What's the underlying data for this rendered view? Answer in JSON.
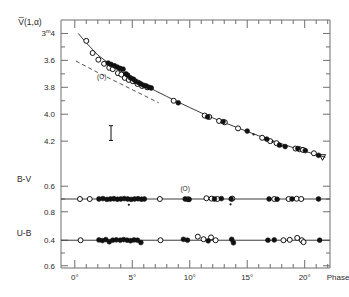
{
  "figure": {
    "background": "#ffffff",
    "frame_color": "#6e6e6e",
    "data_color": "#111111",
    "curve_color": "#3a3a3a"
  },
  "axes": {
    "x": {
      "label": "Phase",
      "unit": "degrees",
      "min": -1.2,
      "max": 22.2,
      "tick_labels": [
        "0°",
        "5°",
        "10°",
        "15°",
        "20°"
      ],
      "tick_values": [
        0,
        5,
        10,
        15,
        20
      ],
      "minor_step": 1
    },
    "panel_v": {
      "label": "V̅(1,α)",
      "tick_labels": [
        "3ᵐ4",
        "3.6",
        "3.8",
        "4.0",
        "4.2"
      ],
      "tick_values": [
        3.4,
        3.6,
        3.8,
        4.0,
        4.2
      ],
      "first_tick_sup": "m",
      "ymin": 3.3,
      "ymax": 4.34,
      "inverted": true
    },
    "panel_bv": {
      "label": "B-V",
      "tick_labels": [
        "0.6",
        "0.8"
      ],
      "tick_values": [
        0.6,
        0.8
      ],
      "ymin": 0.52,
      "ymax": 0.88,
      "inverted": true,
      "fit_line_value": 0.7
    },
    "panel_ub": {
      "label": "U-B",
      "tick_labels": [
        "0.4",
        "0.6"
      ],
      "tick_values": [
        0.4,
        0.6
      ],
      "ymin": 0.32,
      "ymax": 0.68,
      "inverted": true,
      "fit_line_value": 0.4
    }
  },
  "annotations": [
    {
      "name": "opposition-label-v",
      "text": "(O)",
      "x": 2.35,
      "panel": "v",
      "y": 3.74
    },
    {
      "name": "opposition-label-bv",
      "text": "(O)",
      "x": 9.6,
      "panel": "bv",
      "y": 0.635
    }
  ],
  "error_bar": {
    "name": "error-bar-v",
    "x": 3.15,
    "y_center": 4.14,
    "half_height": 0.055
  },
  "chart_data": {
    "type": "scatter",
    "title": "",
    "xlabel": "Phase",
    "ylabel": "V̅(1,α)",
    "xlim": [
      -1.2,
      22.2
    ],
    "grid": false,
    "legend": "none",
    "panels": [
      {
        "name": "V(1,alpha)",
        "ylabel": "V̅(1,α)",
        "ylim": [
          3.3,
          4.34
        ],
        "y_inverted": true,
        "series": [
          {
            "name": "open-circles",
            "marker": "open-circle",
            "x": [
              1.0,
              1.55,
              2.05,
              2.55,
              3.0,
              3.3,
              3.75,
              4.05,
              4.35,
              4.7,
              5.05,
              5.45,
              5.85,
              6.3,
              8.6,
              11.3,
              11.7,
              12.55,
              13.05,
              14.2,
              16.3,
              17.0,
              17.55,
              19.2,
              19.55,
              19.85,
              20.8
            ],
            "y": [
              3.455,
              3.545,
              3.595,
              3.625,
              3.655,
              3.665,
              3.695,
              3.705,
              3.73,
              3.745,
              3.755,
              3.775,
              3.79,
              3.8,
              3.9,
              4.01,
              4.02,
              4.05,
              4.06,
              4.105,
              4.175,
              4.2,
              4.215,
              4.255,
              4.26,
              4.265,
              4.29
            ]
          },
          {
            "name": "filled-circles",
            "marker": "filled-circle",
            "x": [
              2.9,
              3.15,
              3.45,
              3.7,
              3.95,
              4.2,
              4.45,
              4.6,
              4.85,
              5.1,
              5.3,
              5.55,
              5.75,
              6.0,
              6.2,
              6.45,
              6.65,
              9.0,
              11.55,
              12.9,
              15.0,
              16.7,
              17.8,
              18.3,
              19.4,
              20.05,
              21.2
            ],
            "y": [
              3.62,
              3.63,
              3.64,
              3.65,
              3.66,
              3.665,
              3.7,
              3.71,
              3.73,
              3.74,
              3.755,
              3.765,
              3.775,
              3.785,
              3.79,
              3.8,
              3.805,
              3.915,
              4.02,
              4.055,
              4.125,
              4.185,
              4.23,
              4.24,
              4.255,
              4.27,
              4.305
            ]
          },
          {
            "name": "small-dots",
            "marker": "dot",
            "x": [
              4.3,
              5.6,
              6.1,
              15.55,
              17.2,
              18.0
            ],
            "y": [
              3.705,
              3.76,
              3.785,
              4.15,
              4.205,
              4.235
            ]
          },
          {
            "name": "triangle-endpoint",
            "marker": "triangle-down",
            "x": [
              21.55
            ],
            "y": [
              4.32
            ]
          }
        ],
        "fit_curve": {
          "name": "solid-phase-curve",
          "x": [
            0.3,
            1.0,
            2.0,
            3.0,
            4.0,
            5.0,
            6.0,
            7.0,
            8.0,
            9.0,
            10.0,
            11.0,
            12.0,
            13.0,
            14.0,
            15.0,
            16.0,
            17.0,
            18.0,
            19.0,
            20.0,
            21.0,
            21.8
          ],
          "y": [
            3.4,
            3.47,
            3.56,
            3.625,
            3.68,
            3.73,
            3.78,
            3.825,
            3.868,
            3.91,
            3.95,
            3.99,
            4.027,
            4.062,
            4.095,
            4.128,
            4.16,
            4.19,
            4.22,
            4.248,
            4.275,
            4.3,
            4.32
          ]
        },
        "dashed_curve": {
          "name": "dashed-linear-fit",
          "x": [
            0.1,
            2.0,
            4.0,
            6.0,
            7.3
          ],
          "y": [
            3.605,
            3.69,
            3.775,
            3.86,
            3.915
          ]
        }
      },
      {
        "name": "B-V",
        "ylabel": "B-V",
        "ylim": [
          0.52,
          0.88
        ],
        "y_inverted": true,
        "fit_line": 0.7,
        "series": [
          {
            "name": "open-circles",
            "marker": "open-circle",
            "x": [
              0.45,
              1.3,
              7.4,
              9.85,
              11.45,
              11.9,
              12.4,
              13.7,
              17.35,
              18.6,
              19.3,
              19.7
            ],
            "y": [
              0.7,
              0.7,
              0.7,
              0.702,
              0.694,
              0.697,
              0.7,
              0.697,
              0.7,
              0.7,
              0.698,
              0.7
            ]
          },
          {
            "name": "filled-circles",
            "marker": "filled-circle",
            "x": [
              2.1,
              2.45,
              2.8,
              3.1,
              3.4,
              3.7,
              4.0,
              4.3,
              4.6,
              4.9,
              5.2,
              5.5,
              5.8,
              6.05,
              9.6,
              9.95,
              12.15,
              12.75,
              13.6,
              16.9,
              17.6,
              18.9,
              21.2
            ],
            "y": [
              0.7,
              0.697,
              0.703,
              0.7,
              0.698,
              0.702,
              0.7,
              0.697,
              0.7,
              0.703,
              0.7,
              0.698,
              0.702,
              0.7,
              0.7,
              0.703,
              0.7,
              0.697,
              0.7,
              0.7,
              0.702,
              0.7,
              0.7
            ]
          },
          {
            "name": "outlier-dots",
            "marker": "dot",
            "x": [
              4.7,
              13.55
            ],
            "y": [
              0.745,
              0.742
            ]
          }
        ]
      },
      {
        "name": "U-B",
        "ylabel": "U-B",
        "ylim": [
          0.32,
          0.68
        ],
        "y_inverted": true,
        "fit_line": 0.4,
        "series": [
          {
            "name": "open-circles",
            "marker": "open-circle",
            "x": [
              0.5,
              7.45,
              10.7,
              11.2,
              11.85,
              12.25,
              18.15,
              18.7,
              19.35,
              19.75,
              19.9
            ],
            "y": [
              0.4,
              0.4,
              0.372,
              0.392,
              0.378,
              0.4,
              0.4,
              0.397,
              0.382,
              0.4,
              0.415
            ]
          },
          {
            "name": "filled-circles",
            "marker": "filled-circle",
            "x": [
              2.1,
              2.4,
              2.7,
              3.0,
              3.3,
              3.6,
              3.95,
              4.25,
              4.55,
              4.85,
              5.15,
              5.45,
              5.75,
              9.45,
              9.8,
              11.6,
              13.65,
              13.8,
              16.8,
              17.35,
              21.3
            ],
            "y": [
              0.398,
              0.403,
              0.395,
              0.412,
              0.4,
              0.397,
              0.4,
              0.395,
              0.4,
              0.404,
              0.398,
              0.4,
              0.418,
              0.393,
              0.4,
              0.405,
              0.393,
              0.42,
              0.4,
              0.398,
              0.4
            ]
          }
        ]
      }
    ]
  }
}
